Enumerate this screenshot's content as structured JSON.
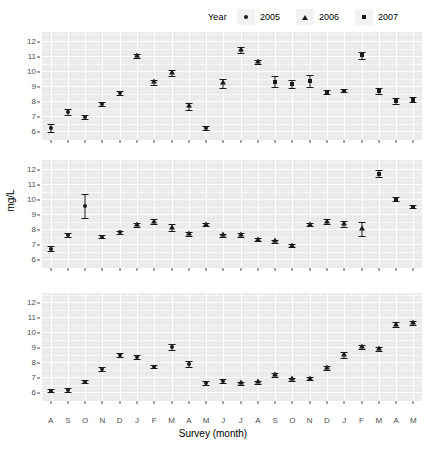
{
  "legend": {
    "title": "Year",
    "items": [
      {
        "label": "2005",
        "shape": "circle-icon"
      },
      {
        "label": "2006",
        "shape": "triangle-icon"
      },
      {
        "label": "2007",
        "shape": "square-icon"
      }
    ]
  },
  "axis": {
    "ylabel": "mg/L",
    "xlabel": "Survey (month)"
  },
  "chart_data": {
    "type": "scatter",
    "title": "",
    "subtitle": "",
    "xlabel": "Survey (month)",
    "ylabel": "mg/L",
    "legend_title": "Year",
    "legend_position": "top-right",
    "grid": true,
    "panels": 3,
    "facet_layout": "3 stacked panels sharing x and y axes",
    "ylim": [
      5.4,
      12.6
    ],
    "yticks": [
      6,
      7,
      8,
      9,
      10,
      11,
      12
    ],
    "ytick_labels": [
      "6",
      "7",
      "8",
      "9",
      "10",
      "11",
      "12"
    ],
    "x": [
      "A",
      "S",
      "O",
      "N",
      "D",
      "J",
      "F",
      "M",
      "A",
      "M",
      "J",
      "J",
      "A",
      "S",
      "O",
      "N",
      "D",
      "J",
      "F",
      "M",
      "A",
      "M"
    ],
    "xtick_labels": [
      "A",
      "S",
      "O",
      "N",
      "D",
      "J",
      "F",
      "M",
      "A",
      "M",
      "J",
      "J",
      "A",
      "S",
      "O",
      "N",
      "D",
      "J",
      "F",
      "M",
      "A",
      "M"
    ],
    "x_count": 22,
    "legend_entries": [
      "2005",
      "2006",
      "2007"
    ],
    "marker_shapes": {
      "2005": "circle",
      "2006": "triangle",
      "2007": "square"
    },
    "error_bars": "vertical, symmetric, capped",
    "series": [
      {
        "name": "panel-1",
        "values": [
          6.2,
          7.25,
          6.95,
          7.8,
          8.55,
          11.0,
          9.25,
          9.9,
          7.65,
          6.2,
          9.2,
          11.4,
          10.6,
          9.3,
          9.15,
          9.35,
          8.6,
          8.7,
          11.05,
          8.7,
          8.0,
          8.1
        ],
        "errors": [
          0.25,
          0.2,
          0.12,
          0.15,
          0.12,
          0.12,
          0.15,
          0.2,
          0.25,
          0.12,
          0.3,
          0.18,
          0.15,
          0.35,
          0.25,
          0.4,
          0.12,
          0.12,
          0.25,
          0.2,
          0.18,
          0.18
        ],
        "shapes": [
          "circle",
          "circle",
          "circle",
          "circle",
          "circle",
          "triangle",
          "triangle",
          "triangle",
          "triangle",
          "circle",
          "triangle",
          "triangle",
          "triangle",
          "square",
          "square",
          "square",
          "square",
          "square",
          "square",
          "square",
          "square",
          "square"
        ]
      },
      {
        "name": "panel-2",
        "values": [
          6.7,
          7.6,
          9.55,
          7.5,
          7.8,
          8.25,
          8.5,
          8.1,
          7.65,
          8.3,
          7.6,
          7.6,
          7.3,
          7.2,
          6.9,
          8.3,
          8.5,
          8.35,
          8.0,
          11.7,
          10.0,
          9.5
        ],
        "errors": [
          0.15,
          0.15,
          0.8,
          0.08,
          0.1,
          0.12,
          0.15,
          0.25,
          0.12,
          0.12,
          0.1,
          0.12,
          0.12,
          0.1,
          0.1,
          0.1,
          0.15,
          0.2,
          0.45,
          0.25,
          0.15,
          0.12
        ],
        "shapes": [
          "circle",
          "circle",
          "circle",
          "circle",
          "circle",
          "triangle",
          "triangle",
          "triangle",
          "triangle",
          "triangle",
          "triangle",
          "triangle",
          "triangle",
          "triangle",
          "triangle",
          "triangle",
          "triangle",
          "triangle",
          "triangle",
          "square",
          "square",
          "square"
        ]
      },
      {
        "name": "panel-3",
        "values": [
          6.1,
          6.15,
          6.7,
          7.55,
          8.45,
          8.35,
          7.7,
          9.0,
          7.9,
          6.6,
          6.75,
          6.6,
          6.65,
          7.15,
          6.85,
          6.9,
          7.6,
          8.5,
          9.0,
          8.85,
          10.5,
          10.6
        ],
        "errors": [
          0.12,
          0.12,
          0.12,
          0.15,
          0.12,
          0.12,
          0.12,
          0.18,
          0.2,
          0.12,
          0.15,
          0.1,
          0.1,
          0.12,
          0.1,
          0.1,
          0.12,
          0.2,
          0.15,
          0.12,
          0.15,
          0.12
        ],
        "shapes": [
          "circle",
          "circle",
          "circle",
          "circle",
          "circle",
          "circle",
          "circle",
          "circle",
          "circle",
          "circle",
          "circle",
          "triangle",
          "triangle",
          "triangle",
          "triangle",
          "triangle",
          "triangle",
          "triangle",
          "triangle",
          "triangle",
          "triangle",
          "triangle"
        ]
      }
    ],
    "panel_extra": [
      {
        "name": "panel-2-tail",
        "x_index": [
          19,
          20,
          21
        ],
        "note": "last points 8.6, 8.6 at A, M"
      },
      {
        "name": "panel-3-tail",
        "x_index": [
          20,
          21
        ],
        "note": "descends to 10.2, 10.1, 9.0, 8.3"
      }
    ],
    "series_tail": [
      {
        "panel": "panel-2",
        "values": [
          8.6,
          8.6
        ],
        "shapes": [
          "square",
          "square"
        ],
        "errors": [
          0.1,
          0.1
        ]
      },
      {
        "panel": "panel-3",
        "values": [
          10.2,
          10.1,
          9.0,
          8.3
        ],
        "shapes": [
          "triangle",
          "triangle",
          "triangle",
          "triangle"
        ],
        "errors": [
          0.12,
          0.12,
          0.15,
          0.15
        ]
      }
    ],
    "colors": {
      "marker": "#1a1a1a",
      "panel_bg": "#ebebeb",
      "grid_major": "#ffffff",
      "axis_text": "#4d4d4d"
    }
  }
}
